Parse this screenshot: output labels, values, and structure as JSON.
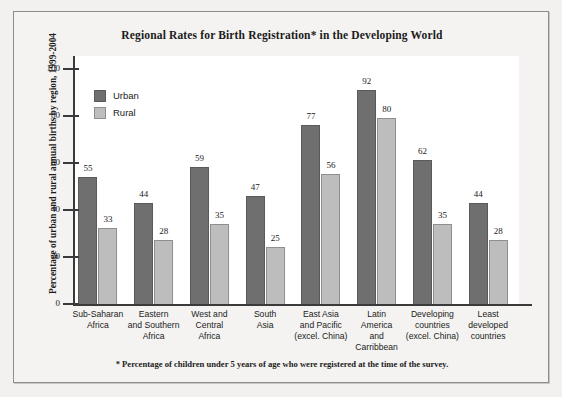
{
  "title": "Regional Rates for Birth Registration* in the Developing World",
  "footnote": "* Percentage of children under 5 years of age who were registered at the time of the survey.",
  "axis": {
    "ylabel": "Percentage of urban and rural annual births by region, 1999-2004",
    "yticks": [
      "0",
      "20",
      "40",
      "60",
      "80",
      "100"
    ]
  },
  "legend": {
    "urban_label": "Urban",
    "rural_label": "Rural"
  },
  "colors": {
    "urban": "#6f6f6f",
    "rural": "#bdbdbd",
    "axis": "#3a3a3a",
    "paper": "#f4f3f1",
    "plot_bg": "#ffffff"
  },
  "chart_data": {
    "type": "bar",
    "title": "Regional Rates for Birth Registration* in the Developing World",
    "xlabel": "",
    "ylabel": "Percentage of urban and rural annual births by region, 1999-2004",
    "ylim": [
      0,
      100
    ],
    "yticks": [
      0,
      20,
      40,
      60,
      80,
      100
    ],
    "grid": false,
    "legend_position": "top-left inside plot",
    "categories": [
      "Sub-Saharan Africa",
      "Eastern and Southern Africa",
      "West and Central Africa",
      "South Asia",
      "East Asia and Pacific (excel. China)",
      "Latin America and Carribbean",
      "Developing countries (excel. China)",
      "Least developed countries"
    ],
    "category_lines": [
      [
        "Sub-Saharan",
        "Africa"
      ],
      [
        "Eastern",
        "and Southern",
        "Africa"
      ],
      [
        "West and",
        "Central",
        "Africa"
      ],
      [
        "South",
        "Asia"
      ],
      [
        "East Asia",
        "and Pacific",
        "(excel. China)"
      ],
      [
        "Latin",
        "America",
        "and",
        "Carribbean"
      ],
      [
        "Developing",
        "countries",
        "(excel. China)"
      ],
      [
        "Least",
        "developed",
        "countries"
      ]
    ],
    "series": [
      {
        "name": "Urban",
        "color": "#6f6f6f",
        "values": [
          55,
          44,
          59,
          47,
          77,
          92,
          62,
          44
        ]
      },
      {
        "name": "Rural",
        "color": "#bdbdbd",
        "values": [
          33,
          28,
          35,
          25,
          56,
          80,
          35,
          28
        ]
      }
    ],
    "annotations": [
      "* Percentage of children under 5 years of age who were registered at the time of the survey."
    ]
  }
}
